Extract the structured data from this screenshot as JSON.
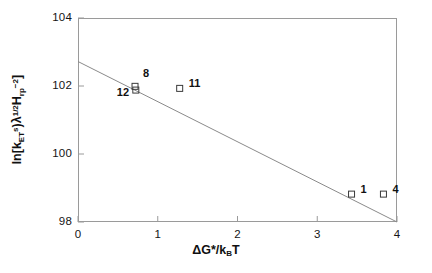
{
  "chart_data": {
    "type": "scatter",
    "title": "",
    "xlabel": "ΔG*/k_BT",
    "ylabel": "ln[k^s_ET λ^(1/2) H_rp^(-2)]",
    "xlim": [
      0,
      4
    ],
    "ylim": [
      98,
      104
    ],
    "xticks": [
      0,
      1,
      2,
      3,
      4
    ],
    "yticks": [
      98,
      100,
      102,
      104
    ],
    "xtick_labels": [
      "0",
      "1",
      "2",
      "3",
      "4"
    ],
    "ytick_labels": [
      "98",
      "100",
      "102",
      "104"
    ],
    "grid": false,
    "legend": false,
    "marker": "open-square",
    "points": [
      {
        "label": "8",
        "x": 0.715,
        "y": 101.99,
        "label_dx": 8,
        "label_dy": -13
      },
      {
        "label": "12",
        "x": 0.725,
        "y": 101.88,
        "label_dx": -19,
        "label_dy": 2
      },
      {
        "label": "11",
        "x": 1.275,
        "y": 101.93,
        "label_dx": 9,
        "label_dy": -5
      },
      {
        "label": "1",
        "x": 3.43,
        "y": 98.82,
        "label_dx": 9,
        "label_dy": -5
      },
      {
        "label": "4",
        "x": 3.83,
        "y": 98.82,
        "label_dx": 9,
        "label_dy": -5
      }
    ],
    "series": [
      {
        "name": "data",
        "x": [
          0.715,
          0.725,
          1.275,
          3.43,
          3.83
        ],
        "values": [
          101.99,
          101.88,
          101.93,
          98.82,
          98.82
        ]
      }
    ],
    "fit_line": {
      "type": "line",
      "x": [
        0,
        4
      ],
      "values": [
        102.72,
        98.0
      ],
      "slope": -1.18,
      "intercept": 102.72
    },
    "axis_color": "#9a9a9a",
    "line_color": "#8a8a8a",
    "marker_color": "#3a3a3a",
    "text_color": "#111111"
  }
}
